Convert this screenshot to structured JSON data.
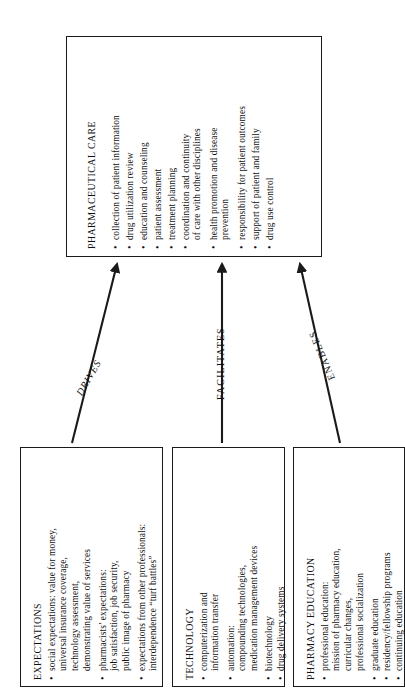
{
  "diagram": {
    "type": "flow-diagram",
    "orientation": "rotated-90-counterclockwise",
    "line_color": "#1a1a1a",
    "background_color": "#ffffff"
  },
  "top_box": {
    "title": "PHARMACEUTICAL CARE",
    "items": [
      {
        "bullet": true,
        "text": "collection of patient information"
      },
      {
        "bullet": true,
        "text": "drug utilization review"
      },
      {
        "bullet": true,
        "text": "education and counseling"
      },
      {
        "bullet": true,
        "text": "patient assessment"
      },
      {
        "bullet": true,
        "text": "treatment planning"
      },
      {
        "bullet": true,
        "text": "coordination and continuity"
      },
      {
        "bullet": false,
        "text": "of care with other disciplines"
      },
      {
        "bullet": true,
        "text": "health promotion and disease"
      },
      {
        "bullet": false,
        "text": "prevention"
      },
      {
        "bullet": true,
        "text": "responsibility for patient outcomes"
      },
      {
        "bullet": true,
        "text": "support of patient and family"
      },
      {
        "bullet": true,
        "text": "drug use control"
      }
    ]
  },
  "bottom_boxes": [
    {
      "id": "expectations",
      "title": "EXPECTATIONS",
      "items": [
        {
          "bullet": true,
          "text": "social expectations: value for money,"
        },
        {
          "bullet": false,
          "text": "universal insurance coverage,"
        },
        {
          "bullet": false,
          "text": "technology assessment,"
        },
        {
          "bullet": false,
          "text": "demonstrating value of services"
        },
        {
          "bullet": true,
          "text": "pharmacists’ expectations:"
        },
        {
          "bullet": false,
          "text": "job satisfaction, job security,"
        },
        {
          "bullet": false,
          "text": "public image of pharmacy"
        },
        {
          "bullet": true,
          "text": "expectations from other professionals:"
        },
        {
          "bullet": false,
          "text": "interdependence “turf battles”"
        }
      ]
    },
    {
      "id": "technology",
      "title": "TECHNOLOGY",
      "items": [
        {
          "bullet": true,
          "text": "computerization and"
        },
        {
          "bullet": false,
          "text": "information transfer"
        },
        {
          "bullet": true,
          "text": "automation:"
        },
        {
          "bullet": false,
          "text": "compounding technologies,"
        },
        {
          "bullet": false,
          "text": "medication management devices"
        },
        {
          "bullet": true,
          "text": "biotechnology"
        },
        {
          "bullet": true,
          "text": "drug delivery systems"
        }
      ]
    },
    {
      "id": "pharmacy-education",
      "title": "PHARMACY EDUCATION",
      "items": [
        {
          "bullet": true,
          "text": "professional education:"
        },
        {
          "bullet": false,
          "text": "mission of pharmacy education,"
        },
        {
          "bullet": false,
          "text": "curricular changes,"
        },
        {
          "bullet": false,
          "text": "professional socialization"
        },
        {
          "bullet": true,
          "text": "graduate education"
        },
        {
          "bullet": true,
          "text": "residency/fellowship programs"
        },
        {
          "bullet": true,
          "text": "continuing education"
        }
      ]
    }
  ],
  "arrows": [
    {
      "id": "drives",
      "label": "DRIVES",
      "from": "expectations",
      "to": "pharmaceutical-care",
      "style": "italic"
    },
    {
      "id": "facilitates",
      "label": "FACILITATES",
      "from": "technology",
      "to": "pharmaceutical-care",
      "style": "normal"
    },
    {
      "id": "enables",
      "label": "ENABLES",
      "from": "pharmacy-education",
      "to": "pharmaceutical-care",
      "style": "normal"
    }
  ]
}
